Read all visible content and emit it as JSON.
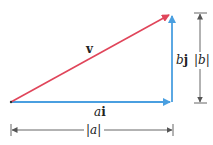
{
  "diagram": {
    "colors": {
      "resultant": "#e0455a",
      "components": "#4a9fe0",
      "dimension": "#555555"
    },
    "vectors": [
      {
        "name": "v",
        "label": "v",
        "from": [
          11,
          102
        ],
        "to": [
          171,
          14
        ],
        "color": "#e0455a"
      },
      {
        "name": "ai",
        "label_coef": "a",
        "label_unit": "i",
        "from": [
          11,
          102
        ],
        "to": [
          170,
          102
        ],
        "color": "#4a9fe0"
      },
      {
        "name": "bj",
        "label_coef": "b",
        "label_unit": "j",
        "from": [
          172,
          102
        ],
        "to": [
          172,
          14
        ],
        "color": "#4a9fe0"
      }
    ],
    "dimensions": {
      "horizontal": {
        "label": "|a|",
        "label_inner": "a",
        "y": 130,
        "x_from": 11,
        "x_to": 173
      },
      "vertical": {
        "label": "|b|",
        "label_inner": "b",
        "x": 200,
        "y_from": 13,
        "y_to": 103
      }
    }
  }
}
